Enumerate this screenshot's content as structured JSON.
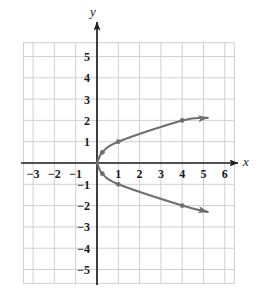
{
  "figure": {
    "background_color": "#ffffff",
    "width": 268,
    "height": 297
  },
  "chart_data": {
    "type": "line",
    "title": "",
    "xlabel": "x",
    "ylabel": "y",
    "xlim": [
      -3.45,
      6.45
    ],
    "ylim": [
      -5.65,
      5.65
    ],
    "grid": true,
    "grid_color": "#d0d0d2",
    "grid_spacing_units": 1,
    "axis_color": "#231f20",
    "curve_color": "#6f6f71",
    "marker_color": "#6f6f71",
    "legend": null,
    "xticks": [
      -3,
      -2,
      -1,
      1,
      2,
      3,
      4,
      5,
      6
    ],
    "xtick_labels": [
      "−3",
      "−2",
      "−1",
      "1",
      "2",
      "3",
      "4",
      "5",
      "6"
    ],
    "yticks": [
      5,
      4,
      3,
      2,
      1,
      -1,
      -2,
      -3,
      -4,
      -5
    ],
    "ytick_labels": [
      "5",
      "4",
      "3",
      "2",
      "1",
      "−1",
      "−2",
      "−3",
      "−4",
      "−5"
    ],
    "equation": "x = y^2",
    "series": [
      {
        "name": "upper-branch",
        "arrow_end": true,
        "points": [
          {
            "x": 0,
            "y": 0
          },
          {
            "x": 0.25,
            "y": 0.5
          },
          {
            "x": 1,
            "y": 1
          },
          {
            "x": 4,
            "y": 2
          },
          {
            "x": 5.2,
            "y": 2.12
          }
        ],
        "markers": [
          {
            "x": 0.25,
            "y": 0.5
          },
          {
            "x": 1,
            "y": 1
          },
          {
            "x": 4,
            "y": 2
          }
        ]
      },
      {
        "name": "lower-branch",
        "arrow_end": true,
        "points": [
          {
            "x": 0,
            "y": 0
          },
          {
            "x": 0.25,
            "y": -0.5
          },
          {
            "x": 1,
            "y": -1
          },
          {
            "x": 4,
            "y": -2
          },
          {
            "x": 5.2,
            "y": -2.3
          }
        ],
        "markers": [
          {
            "x": 0.25,
            "y": -0.5
          },
          {
            "x": 1,
            "y": -1
          },
          {
            "x": 4,
            "y": -2
          }
        ]
      }
    ]
  }
}
